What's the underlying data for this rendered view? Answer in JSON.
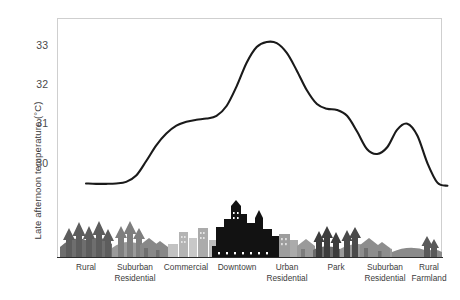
{
  "chart_data": {
    "type": "line",
    "title": "",
    "subtitle": "",
    "xlabel": "",
    "ylabel": "Late afternoon temperature (°C)",
    "ylim": [
      29.1,
      33.55
    ],
    "yticks": [
      30,
      31,
      32,
      33
    ],
    "ytick_labels": [
      "30",
      "31",
      "32",
      "33"
    ],
    "grid": false,
    "legend": "none",
    "categories": [
      "Rural",
      "Suburban\nResidential",
      "Commercial",
      "Downtown",
      "Urban\nResidential",
      "Park",
      "Suburban\nResidential",
      "Rural\nFarmland"
    ],
    "series": [
      {
        "name": "Late afternoon temperature",
        "color": "#1a1a1a",
        "x": [
          0.0,
          0.2,
          0.4,
          0.6,
          0.8,
          1.0,
          1.2,
          1.4,
          1.6,
          1.8,
          2.0,
          2.2,
          2.4,
          2.6,
          2.8,
          3.0,
          3.2,
          3.4,
          3.6,
          3.8,
          4.0,
          4.2,
          4.4,
          4.6,
          4.8,
          5.0,
          5.2,
          5.4,
          5.6,
          5.8,
          6.0,
          6.2,
          6.4,
          6.6,
          6.8,
          7.0,
          7.2
        ],
        "values": [
          29.48,
          29.47,
          29.47,
          29.48,
          29.52,
          29.68,
          30.05,
          30.45,
          30.75,
          30.95,
          31.05,
          31.1,
          31.13,
          31.2,
          31.45,
          31.95,
          32.55,
          32.95,
          33.08,
          33.05,
          32.8,
          32.35,
          31.85,
          31.5,
          31.38,
          31.35,
          31.2,
          30.8,
          30.35,
          30.23,
          30.4,
          30.85,
          31.0,
          30.7,
          30.0,
          29.5,
          29.42
        ]
      }
    ],
    "annotations": {
      "peak_label": "33.1",
      "baseline_rural": "29.5",
      "park_dip": "30.2"
    },
    "skyline": {
      "caption": "Land-use cross-section silhouette",
      "zones": [
        {
          "name": "rural-trees",
          "tone": "#6e6e6e"
        },
        {
          "name": "suburban-houses",
          "tone": "#9a9a9a"
        },
        {
          "name": "commercial-blocks",
          "tone": "#bcbcbc"
        },
        {
          "name": "downtown-towers",
          "tone": "#121212"
        },
        {
          "name": "urban-residential",
          "tone": "#a0a0a0"
        },
        {
          "name": "park-trees",
          "tone": "#3d3d3d"
        },
        {
          "name": "suburban-houses-2",
          "tone": "#9a9a9a"
        },
        {
          "name": "rural-farmland",
          "tone": "#8a8a8a"
        }
      ]
    }
  },
  "axis": {
    "y_title": "Late afternoon temperature (°C)"
  }
}
